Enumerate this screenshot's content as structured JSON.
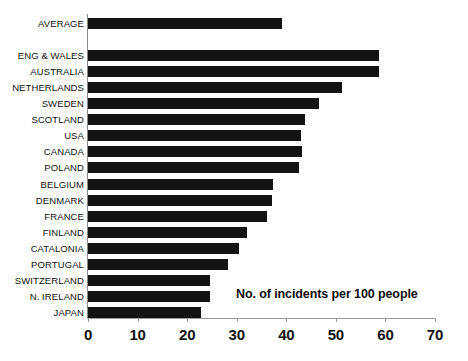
{
  "chart_data": {
    "type": "bar",
    "orientation": "horizontal",
    "title": "",
    "annotation": "No. of incidents per 100 people",
    "xlabel": "",
    "ylabel": "",
    "xlim": [
      0,
      70
    ],
    "xticks": [
      0,
      10,
      20,
      30,
      40,
      50,
      60,
      70
    ],
    "grid": false,
    "legend": null,
    "bar_color": "#131313",
    "axis_color": "#9a9a9a",
    "gap_after_first_category": true,
    "categories": [
      "AVERAGE",
      "",
      "ENG & WALES",
      "AUSTRALIA",
      "NETHERLANDS",
      "SWEDEN",
      "SCOTLAND",
      "USA",
      "CANADA",
      "POLAND",
      "BELGIUM",
      "DENMARK",
      "FRANCE",
      "FINLAND",
      "CATALONIA",
      "PORTUGAL",
      "SWITZERLAND",
      "N. IRELAND",
      "JAPAN"
    ],
    "values": [
      39.1,
      null,
      58.7,
      58.7,
      51.2,
      46.6,
      43.8,
      42.9,
      43.1,
      42.5,
      37.3,
      37.1,
      36.1,
      32.0,
      30.5,
      28.2,
      24.6,
      24.6,
      22.8
    ]
  }
}
